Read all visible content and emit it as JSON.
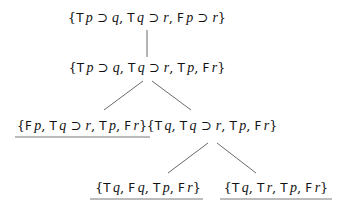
{
  "diagram": {
    "type": "tableau",
    "nodes": [
      {
        "id": "n1",
        "label": "{T p ⊃ q, T q ⊃ r, F p ⊃ r}",
        "closed": false
      },
      {
        "id": "n2",
        "label": "{T p ⊃ q, T q ⊃ r, T p, F r}",
        "closed": false
      },
      {
        "id": "n3",
        "label": "{F p, T q ⊃ r, T p, F r}",
        "closed": true
      },
      {
        "id": "n4",
        "label": "{T q, T q ⊃ r, T p, F r}",
        "closed": false
      },
      {
        "id": "n5",
        "label": "{T q, F q, T p, F r}",
        "closed": true
      },
      {
        "id": "n6",
        "label": "{T q, T r, T p, F r}",
        "closed": true
      }
    ],
    "edges": [
      {
        "from": "n1",
        "to": "n2"
      },
      {
        "from": "n2",
        "to": "n3"
      },
      {
        "from": "n2",
        "to": "n4"
      },
      {
        "from": "n4",
        "to": "n5"
      },
      {
        "from": "n4",
        "to": "n6"
      }
    ]
  }
}
